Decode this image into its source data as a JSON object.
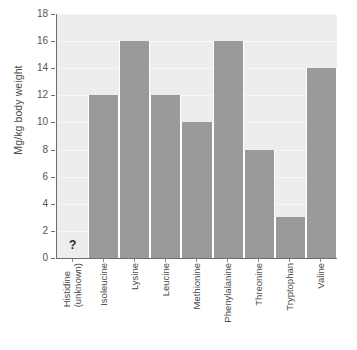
{
  "chart_data": {
    "type": "bar",
    "title": "",
    "subtitle": "",
    "xlabel": "",
    "ylabel": "Mg/kg body weight",
    "ylim": [
      0,
      18
    ],
    "ytick_step": 2,
    "yticks": [
      "0",
      "2",
      "4",
      "6",
      "8",
      "10",
      "12",
      "14",
      "16",
      "18"
    ],
    "grid": true,
    "legend": null,
    "categories": [
      "Histidine (unknown)",
      "Isoleucine",
      "Lysine",
      "Leucine",
      "Methionine",
      "Phenylalanine",
      "Threonine",
      "Tryptophan",
      "Valine"
    ],
    "values": [
      null,
      12,
      16,
      12,
      10,
      16,
      8,
      3,
      14
    ],
    "annotations": [
      {
        "category": "Histidine (unknown)",
        "text": "?",
        "note": "value unknown"
      }
    ],
    "colors": {
      "bar": "#9a9a9a",
      "plot_background": "#ededed",
      "gridline": "#f7f7f7",
      "axis": "#6f6f6f",
      "text": "#4a4a4a",
      "page_background": "#ffffff"
    }
  },
  "axis": {
    "y_title": "Mg/kg body weight",
    "y_tick_labels": [
      "18",
      "16",
      "14",
      "12",
      "10",
      "8",
      "6",
      "4",
      "2",
      "0"
    ],
    "x_tick_labels": [
      {
        "line1": "Histidine",
        "line2": "(unknown)"
      },
      {
        "line1": "Isoleucine",
        "line2": ""
      },
      {
        "line1": "Lysine",
        "line2": ""
      },
      {
        "line1": "Leucine",
        "line2": ""
      },
      {
        "line1": "Methionine",
        "line2": ""
      },
      {
        "line1": "Phenylalanine",
        "line2": ""
      },
      {
        "line1": "Threonine",
        "line2": ""
      },
      {
        "line1": "Tryptophan",
        "line2": ""
      },
      {
        "line1": "Valine",
        "line2": ""
      }
    ]
  },
  "markers": {
    "unknown": "?"
  },
  "caption": {
    "text": ""
  }
}
